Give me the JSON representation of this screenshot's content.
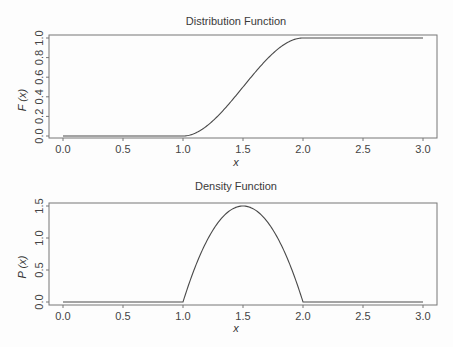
{
  "chart_data": [
    {
      "type": "line",
      "title": "Distribution Function",
      "xlabel": "x",
      "ylabel": "F (x)",
      "xlim": [
        0.0,
        3.0
      ],
      "ylim": [
        0.0,
        1.0
      ],
      "xticks": [
        "0.0",
        "0.5",
        "1.0",
        "1.5",
        "2.0",
        "2.5",
        "3.0"
      ],
      "yticks": [
        "0.0",
        "0.2",
        "0.4",
        "0.6",
        "0.8",
        "1.0"
      ],
      "grid": false,
      "series": [
        {
          "name": "F(x)",
          "x": [
            0.0,
            0.5,
            1.0,
            1.1,
            1.2,
            1.3,
            1.4,
            1.5,
            1.6,
            1.7,
            1.8,
            1.9,
            2.0,
            2.5,
            3.0
          ],
          "y": [
            0.0,
            0.0,
            0.0,
            0.028,
            0.104,
            0.216,
            0.352,
            0.5,
            0.648,
            0.784,
            0.896,
            0.972,
            1.0,
            1.0,
            1.0
          ]
        }
      ]
    },
    {
      "type": "line",
      "title": "Density Function",
      "xlabel": "x",
      "ylabel": "P (x)",
      "xlim": [
        0.0,
        3.0
      ],
      "ylim": [
        0.0,
        1.5
      ],
      "xticks": [
        "0.0",
        "0.5",
        "1.0",
        "1.5",
        "2.0",
        "2.5",
        "3.0"
      ],
      "yticks": [
        "0.0",
        "0.5",
        "1.0",
        "1.5"
      ],
      "grid": false,
      "series": [
        {
          "name": "P(x)",
          "x": [
            0.0,
            0.5,
            1.0,
            1.1,
            1.2,
            1.3,
            1.4,
            1.5,
            1.6,
            1.7,
            1.8,
            1.9,
            2.0,
            2.5,
            3.0
          ],
          "y": [
            0.0,
            0.0,
            0.0,
            0.54,
            0.96,
            1.26,
            1.44,
            1.5,
            1.44,
            1.26,
            0.96,
            0.54,
            0.0,
            0.0,
            0.0
          ]
        }
      ]
    }
  ]
}
